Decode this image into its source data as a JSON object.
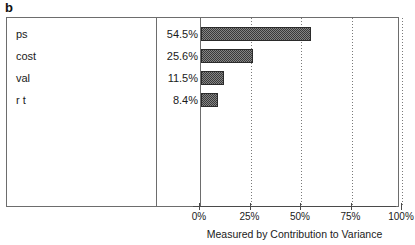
{
  "panel_label": "b",
  "chart_data": {
    "type": "bar",
    "orientation": "horizontal",
    "title": "b",
    "xlabel": "Measured by Contribution to Variance",
    "ylabel": "",
    "xlim": [
      0,
      100
    ],
    "grid": true,
    "legend": null,
    "categories": [
      "ps",
      "cost",
      "val",
      "r t"
    ],
    "values": [
      54.5,
      25.6,
      11.5,
      8.4
    ],
    "value_labels": [
      "54.5%",
      "25.6%",
      "11.5%",
      "8.4%"
    ],
    "xticks": [
      0,
      25,
      50,
      75,
      100
    ],
    "xtick_labels": [
      "0%",
      "25%",
      "50%",
      "75%",
      "100%"
    ],
    "bar_color": "#3a3a3a",
    "bar_fill": "dark-dithered-hatch"
  },
  "rows": [
    {
      "name": "ps",
      "value_label": "54.5%",
      "value": 54.5
    },
    {
      "name": "cost",
      "value_label": "25.6%",
      "value": 25.6
    },
    {
      "name": "val",
      "value_label": "11.5%",
      "value": 11.5
    },
    {
      "name": "r t",
      "value_label": "8.4%",
      "value": 8.4
    }
  ],
  "axis": {
    "title": "Measured by Contribution to Variance",
    "ticks": [
      {
        "label": "0%",
        "value": 0
      },
      {
        "label": "25%",
        "value": 25
      },
      {
        "label": "50%",
        "value": 50
      },
      {
        "label": "75%",
        "value": 75
      },
      {
        "label": "100%",
        "value": 100
      }
    ]
  }
}
